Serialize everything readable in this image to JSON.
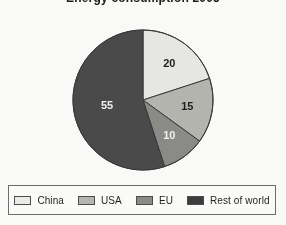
{
  "title": "Energy consumption 2005",
  "chart_data": {
    "type": "pie",
    "title": "Energy consumption 2005",
    "xlabel": "",
    "ylabel": "",
    "total": 100,
    "start_angle_deg": 0,
    "direction": "clockwise",
    "legend_position": "bottom",
    "grid": false,
    "categories": [
      "China",
      "USA",
      "EU",
      "Rest of world"
    ],
    "values": [
      20,
      15,
      10,
      55
    ],
    "labels": [
      "20",
      "15",
      "10",
      "55"
    ],
    "colors": [
      "#e8e8e4",
      "#b6b6b1",
      "#8b8b88",
      "#4a4a4a"
    ],
    "label_colors": [
      "#1e1e1e",
      "#1e1e1e",
      "#f2f2f2",
      "#f2f2f2"
    ],
    "slices": [
      {
        "name": "China",
        "value": 20,
        "label": "20",
        "color": "#e8e8e4",
        "label_color": "#1e1e1e"
      },
      {
        "name": "USA",
        "value": 15,
        "label": "15",
        "color": "#b6b6b1",
        "label_color": "#1e1e1e"
      },
      {
        "name": "EU",
        "value": 10,
        "label": "10",
        "color": "#8b8b88",
        "label_color": "#f2f2f2"
      },
      {
        "name": "Rest of world",
        "value": 55,
        "label": "55",
        "color": "#4a4a4a",
        "label_color": "#f2f2f2"
      }
    ]
  },
  "legend": {
    "items": [
      {
        "label": "China",
        "color": "#ececea"
      },
      {
        "label": "USA",
        "color": "#b8b8b3"
      },
      {
        "label": "EU",
        "color": "#8b8b88"
      },
      {
        "label": "Rest of world",
        "color": "#3d3d3d"
      }
    ]
  },
  "geometry": {
    "center_x": 143,
    "center_y": 93,
    "radius": 70
  }
}
